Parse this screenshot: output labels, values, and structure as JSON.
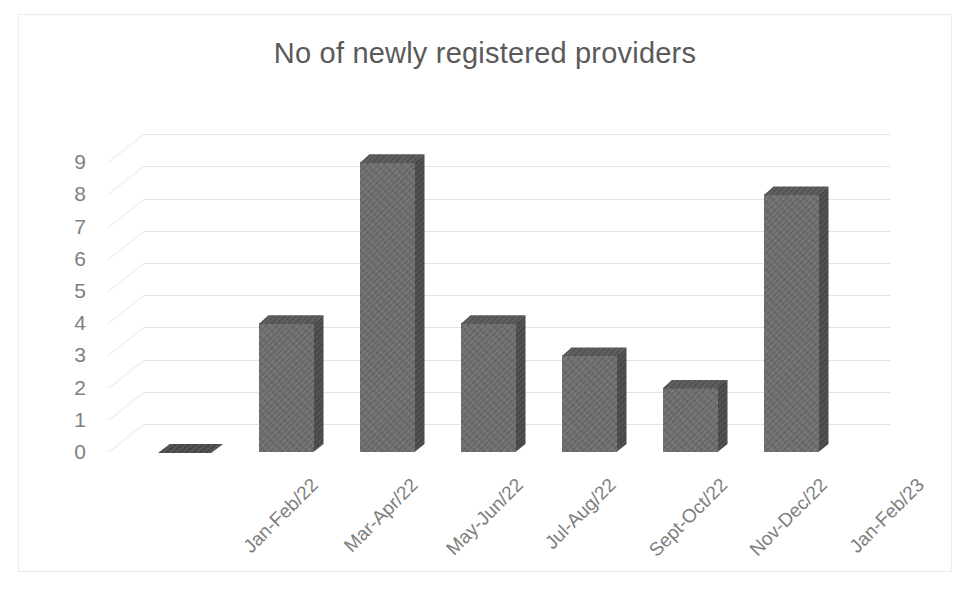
{
  "chart_data": {
    "type": "bar",
    "title": "No of newly registered providers",
    "xlabel": "",
    "ylabel": "",
    "categories": [
      "Jan-Feb/22",
      "Mar-Apr/22",
      "May-Jun/22",
      "Jul-Aug/22",
      "Sept-Oct/22",
      "Nov-Dec/22",
      "Jan-Feb/23"
    ],
    "values": [
      0,
      4,
      9,
      4,
      3,
      2,
      8
    ],
    "ylim": [
      0,
      9
    ],
    "yticks": [
      0,
      1,
      2,
      3,
      4,
      5,
      6,
      7,
      8,
      9
    ],
    "ytick_labels": [
      "0",
      "1",
      "2",
      "3",
      "4",
      "5",
      "6",
      "7",
      "8",
      "9"
    ],
    "grid": true,
    "legend": false,
    "style": "3d-column",
    "colors": {
      "bar_front": "#6d6d6d",
      "bar_side": "#4b4b4b",
      "bar_top": "#575757",
      "gridline": "#e3e3e4",
      "title_text": "#5a5a5a",
      "tick_text": "#808080",
      "plot_background": "#ffffff",
      "frame_border": "#ececed"
    }
  }
}
